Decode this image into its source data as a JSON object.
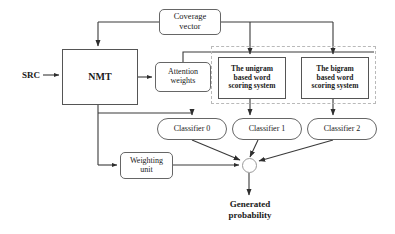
{
  "diagram": {
    "background_color": "#ffffff",
    "line_color": "#3a3a3a",
    "group_border_color": "#b9b9b9",
    "nodes": {
      "src": {
        "label": "SRC",
        "x": 14,
        "y": 68,
        "w": 34,
        "h": 14,
        "bold": true,
        "font_size": 9
      },
      "nmt": {
        "label": "NMT",
        "x": 62,
        "y": 49,
        "w": 76,
        "h": 56,
        "bold": true,
        "font_size": 10
      },
      "coverage_vector": {
        "label": "Coverage\nvector",
        "x": 159,
        "y": 9,
        "w": 62,
        "h": 26,
        "bold": false,
        "font_size": 8.5
      },
      "attention_weights": {
        "label": "Attention\nweights",
        "x": 155,
        "y": 62,
        "w": 56,
        "h": 30,
        "bold": false,
        "font_size": 8
      },
      "unigram_system": {
        "label": "The unigram\nbased word\nscoring system",
        "x": 218,
        "y": 57,
        "w": 68,
        "h": 42,
        "bold": true,
        "font_size": 7.5
      },
      "bigram_system": {
        "label": "The bigram\nbased word\nscoring system",
        "x": 301,
        "y": 57,
        "w": 68,
        "h": 42,
        "bold": true,
        "font_size": 7.5
      },
      "classifier_0": {
        "label": "Classifier 0",
        "x": 157,
        "y": 118,
        "w": 70,
        "h": 22,
        "bold": false,
        "font_size": 8
      },
      "classifier_1": {
        "label": "Classifier 1",
        "x": 232,
        "y": 118,
        "w": 70,
        "h": 22,
        "bold": false,
        "font_size": 8
      },
      "classifier_2": {
        "label": "Classifier 2",
        "x": 307,
        "y": 118,
        "w": 70,
        "h": 22,
        "bold": false,
        "font_size": 8
      },
      "weighting_unit": {
        "label": "Weighting\nunit",
        "x": 120,
        "y": 152,
        "w": 53,
        "h": 27,
        "bold": false,
        "font_size": 8
      },
      "merge_point": {
        "label": "",
        "x": 242,
        "y": 158,
        "w": 15,
        "h": 15
      },
      "generated_probability": {
        "label": "Generated\nprobability",
        "x": 210,
        "y": 199,
        "w": 80,
        "h": 28,
        "bold": true,
        "font_size": 9
      }
    },
    "groups": {
      "scoring_systems_group": {
        "label": "",
        "x": 211,
        "y": 46,
        "w": 165,
        "h": 58
      }
    },
    "edges": [
      {
        "id": "src-to-nmt",
        "from": "src",
        "to": "nmt",
        "label": ""
      },
      {
        "id": "nmt-to-attention-weights",
        "from": "nmt",
        "to": "attention_weights",
        "label": ""
      },
      {
        "id": "coverage-vector-to-nmt",
        "from": "coverage_vector",
        "to": "nmt",
        "label": ""
      },
      {
        "id": "coverage-vector-to-unigram-system",
        "from": "coverage_vector",
        "to": "unigram_system",
        "label": ""
      },
      {
        "id": "coverage-vector-to-bigram-system",
        "from": "coverage_vector",
        "to": "bigram_system",
        "label": ""
      },
      {
        "id": "attention-weights-to-scoring-group",
        "from": "attention_weights",
        "to": "scoring_systems_group",
        "label": ""
      },
      {
        "id": "nmt-to-coverage-vector",
        "from": "nmt",
        "to": "coverage_vector",
        "label": ""
      },
      {
        "id": "nmt-to-classifier-0",
        "from": "nmt",
        "to": "classifier_0",
        "label": ""
      },
      {
        "id": "nmt-to-weighting-unit",
        "from": "nmt",
        "to": "weighting_unit",
        "label": ""
      },
      {
        "id": "unigram-system-to-classifier-1",
        "from": "unigram_system",
        "to": "classifier_1",
        "label": ""
      },
      {
        "id": "bigram-system-to-classifier-2",
        "from": "bigram_system",
        "to": "classifier_2",
        "label": ""
      },
      {
        "id": "classifier-0-to-merge",
        "from": "classifier_0",
        "to": "merge_point",
        "label": ""
      },
      {
        "id": "classifier-1-to-merge",
        "from": "classifier_1",
        "to": "merge_point",
        "label": ""
      },
      {
        "id": "classifier-2-to-merge",
        "from": "classifier_2",
        "to": "merge_point",
        "label": ""
      },
      {
        "id": "weighting-unit-to-merge",
        "from": "weighting_unit",
        "to": "merge_point",
        "label": ""
      },
      {
        "id": "merge-to-generated-probability",
        "from": "merge_point",
        "to": "generated_probability",
        "label": ""
      }
    ]
  }
}
